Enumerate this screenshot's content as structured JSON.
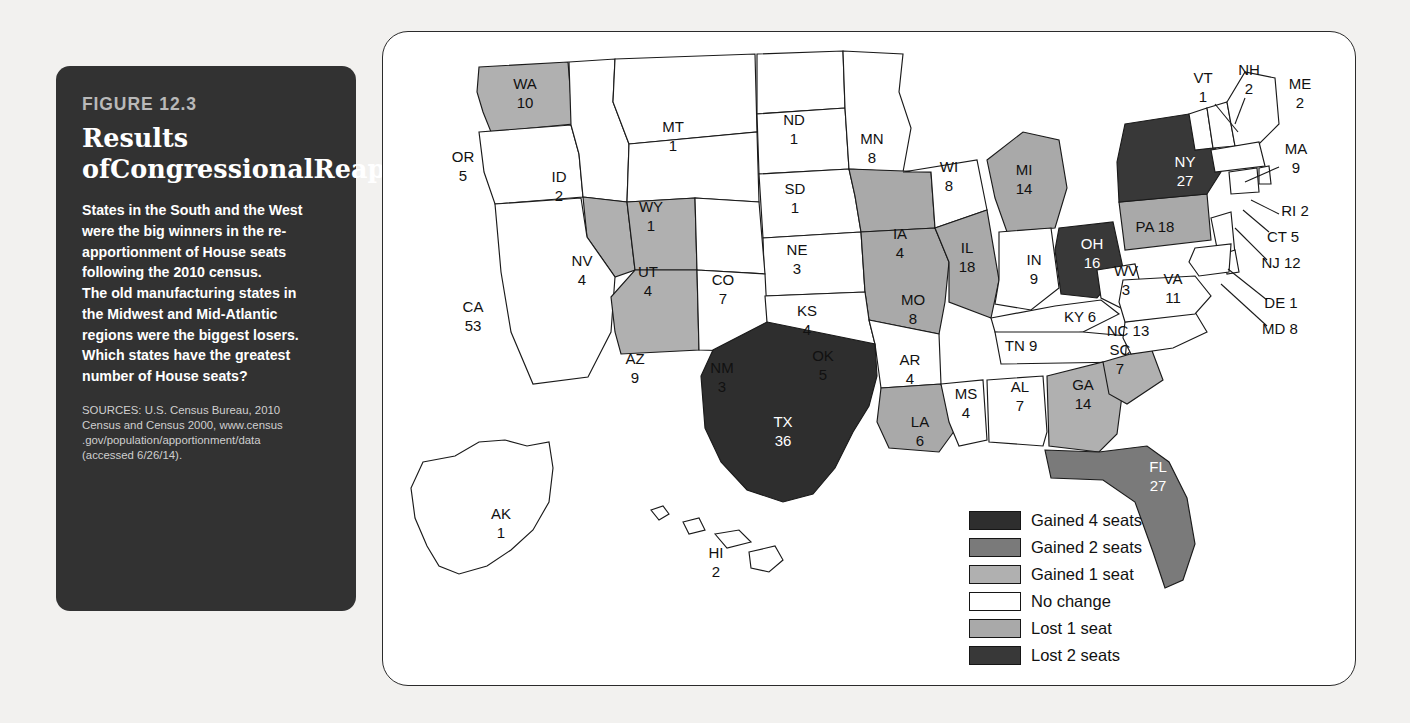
{
  "figure": {
    "number": "FIGURE 12.3",
    "title_lines": [
      "Results of",
      "Congressional",
      "Reapportionment,",
      "2010"
    ],
    "body_lines": [
      "States in the South and the West",
      "were the big winners in the re-",
      "apportionment of House seats",
      "following the 2010 census.",
      "The old manufacturing states in",
      "the Midwest and Mid-Atlantic",
      "regions were the biggest losers.",
      "Which states have the greatest",
      "number of House seats?"
    ],
    "sources_lines": [
      "SOURCES: U.S. Census Bureau, 2010",
      "Census and Census 2000, www.census",
      ".gov/population/apportionment/data",
      "(accessed 6/26/14)."
    ]
  },
  "colors": {
    "gained4": "#2e2e2e",
    "gained2": "#7a7a7a",
    "gained1": "#b0b0b0",
    "nochange": "#ffffff",
    "lost1": "#a9a9a9",
    "lost2": "#383838",
    "card_bg": "#323232",
    "page_bg": "#f2f1ef",
    "outline": "#1a1a1a"
  },
  "legend": {
    "title": "",
    "items": [
      {
        "label": "Gained 4 seats",
        "color": "#2e2e2e",
        "key": "gained4"
      },
      {
        "label": "Gained 2 seats",
        "color": "#7a7a7a",
        "key": "gained2"
      },
      {
        "label": "Gained 1 seat",
        "color": "#b0b0b0",
        "key": "gained1"
      },
      {
        "label": "No change",
        "color": "#ffffff",
        "key": "nochange"
      },
      {
        "label": "Lost 1 seat",
        "color": "#a9a9a9",
        "key": "lost1"
      },
      {
        "label": "Lost 2 seats",
        "color": "#383838",
        "key": "lost2"
      }
    ]
  },
  "chart_data": {
    "type": "map",
    "value_label": "House seats",
    "category_label": "Reapportionment change",
    "categories": [
      "Gained 4 seats",
      "Gained 2 seats",
      "Gained 1 seat",
      "No change",
      "Lost 1 seat",
      "Lost 2 seats"
    ],
    "states": [
      {
        "code": "WA",
        "seats": 10,
        "category": "Gained 1 seat",
        "label_x": 142,
        "label_y": 62,
        "light_text": false
      },
      {
        "code": "OR",
        "seats": 5,
        "category": "No change",
        "label_x": 80,
        "label_y": 135,
        "light_text": false
      },
      {
        "code": "ID",
        "seats": 2,
        "category": "No change",
        "label_x": 176,
        "label_y": 155,
        "light_text": false
      },
      {
        "code": "MT",
        "seats": 1,
        "category": "No change",
        "label_x": 290,
        "label_y": 105,
        "light_text": false
      },
      {
        "code": "WY",
        "seats": 1,
        "category": "No change",
        "label_x": 268,
        "label_y": 185,
        "light_text": false
      },
      {
        "code": "ND",
        "seats": 1,
        "category": "No change",
        "label_x": 411,
        "label_y": 98,
        "light_text": false
      },
      {
        "code": "SD",
        "seats": 1,
        "category": "No change",
        "label_x": 412,
        "label_y": 167,
        "light_text": false
      },
      {
        "code": "NE",
        "seats": 3,
        "category": "No change",
        "label_x": 414,
        "label_y": 228,
        "light_text": false
      },
      {
        "code": "KS",
        "seats": 4,
        "category": "No change",
        "label_x": 424,
        "label_y": 289,
        "light_text": false
      },
      {
        "code": "MN",
        "seats": 8,
        "category": "No change",
        "label_x": 489,
        "label_y": 117,
        "light_text": false
      },
      {
        "code": "IA",
        "seats": 4,
        "category": "Lost 1 seat",
        "label_x": 517,
        "label_y": 212,
        "light_text": false
      },
      {
        "code": "MO",
        "seats": 8,
        "category": "Lost 1 seat",
        "label_x": 530,
        "label_y": 278,
        "light_text": false
      },
      {
        "code": "WI",
        "seats": 8,
        "category": "No change",
        "label_x": 566,
        "label_y": 145,
        "light_text": false
      },
      {
        "code": "IL",
        "seats": 18,
        "category": "Lost 1 seat",
        "label_x": 584,
        "label_y": 226,
        "light_text": false
      },
      {
        "code": "MI",
        "seats": 14,
        "category": "Lost 1 seat",
        "label_x": 641,
        "label_y": 148,
        "light_text": false
      },
      {
        "code": "IN",
        "seats": 9,
        "category": "No change",
        "label_x": 651,
        "label_y": 238,
        "light_text": false
      },
      {
        "code": "OH",
        "seats": 16,
        "category": "Lost 2 seats",
        "label_x": 709,
        "label_y": 222,
        "light_text": true
      },
      {
        "code": "KY",
        "seats": 6,
        "category": "No change",
        "label_x": 697,
        "label_y": 286,
        "light_text": false
      },
      {
        "code": "NV",
        "seats": 4,
        "category": "Gained 1 seat",
        "label_x": 199,
        "label_y": 239,
        "light_text": false
      },
      {
        "code": "UT",
        "seats": 4,
        "category": "Gained 1 seat",
        "label_x": 265,
        "label_y": 250,
        "light_text": false
      },
      {
        "code": "CO",
        "seats": 7,
        "category": "No change",
        "label_x": 340,
        "label_y": 258,
        "light_text": false
      },
      {
        "code": "CA",
        "seats": 53,
        "category": "No change",
        "label_x": 90,
        "label_y": 285,
        "light_text": false
      },
      {
        "code": "AZ",
        "seats": 9,
        "category": "Gained 1 seat",
        "label_x": 252,
        "label_y": 337,
        "light_text": false
      },
      {
        "code": "NM",
        "seats": 3,
        "category": "No change",
        "label_x": 339,
        "label_y": 346,
        "light_text": false
      },
      {
        "code": "OK",
        "seats": 5,
        "category": "No change",
        "label_x": 440,
        "label_y": 334,
        "light_text": false
      },
      {
        "code": "AR",
        "seats": 4,
        "category": "No change",
        "label_x": 527,
        "label_y": 338,
        "light_text": false
      },
      {
        "code": "TX",
        "seats": 36,
        "category": "Gained 4 seats",
        "label_x": 400,
        "label_y": 400,
        "light_text": true
      },
      {
        "code": "LA",
        "seats": 6,
        "category": "Lost 1 seat",
        "label_x": 537,
        "label_y": 400,
        "light_text": false
      },
      {
        "code": "MS",
        "seats": 4,
        "category": "No change",
        "label_x": 583,
        "label_y": 372,
        "light_text": false
      },
      {
        "code": "AL",
        "seats": 7,
        "category": "No change",
        "label_x": 637,
        "label_y": 365,
        "light_text": false
      },
      {
        "code": "TN",
        "seats": 9,
        "category": "No change",
        "label_x": 638,
        "label_y": 315,
        "light_text": false
      },
      {
        "code": "GA",
        "seats": 14,
        "category": "Gained 1 seat",
        "label_x": 700,
        "label_y": 363,
        "light_text": false
      },
      {
        "code": "SC",
        "seats": 7,
        "category": "Gained 1 seat",
        "label_x": 737,
        "label_y": 328,
        "light_text": false
      },
      {
        "code": "NC",
        "seats": 13,
        "category": "No change",
        "label_x": 745,
        "label_y": 300,
        "light_text": false
      },
      {
        "code": "FL",
        "seats": 27,
        "category": "Gained 2 seats",
        "label_x": 775,
        "label_y": 445,
        "light_text": true
      },
      {
        "code": "WV",
        "seats": 3,
        "category": "No change",
        "label_x": 743,
        "label_y": 249,
        "light_text": false
      },
      {
        "code": "VA",
        "seats": 11,
        "category": "No change",
        "label_x": 790,
        "label_y": 257,
        "light_text": false
      },
      {
        "code": "PA",
        "seats": 18,
        "category": "Lost 1 seat",
        "label_x": 772,
        "label_y": 196,
        "light_text": false
      },
      {
        "code": "NY",
        "seats": 27,
        "category": "Lost 2 seats",
        "label_x": 802,
        "label_y": 140,
        "light_text": true
      },
      {
        "code": "VT",
        "seats": 1,
        "category": "No change",
        "label_x": 820,
        "label_y": 56,
        "light_text": false
      },
      {
        "code": "NH",
        "seats": 2,
        "category": "No change",
        "label_x": 866,
        "label_y": 48,
        "light_text": false
      },
      {
        "code": "ME",
        "seats": 2,
        "category": "No change",
        "label_x": 917,
        "label_y": 62,
        "light_text": false
      },
      {
        "code": "MA",
        "seats": 9,
        "category": "No change",
        "label_x": 913,
        "label_y": 127,
        "light_text": false
      },
      {
        "code": "RI",
        "seats": 2,
        "category": "No change",
        "label_x": 912,
        "label_y": 180,
        "light_text": false
      },
      {
        "code": "CT",
        "seats": 5,
        "category": "No change",
        "label_x": 900,
        "label_y": 206,
        "light_text": false
      },
      {
        "code": "NJ",
        "seats": 12,
        "category": "No change",
        "label_x": 898,
        "label_y": 232,
        "light_text": false
      },
      {
        "code": "DE",
        "seats": 1,
        "category": "No change",
        "label_x": 898,
        "label_y": 272,
        "light_text": false
      },
      {
        "code": "MD",
        "seats": 8,
        "category": "No change",
        "label_x": 897,
        "label_y": 298,
        "light_text": false
      },
      {
        "code": "AK",
        "seats": 1,
        "category": "No change",
        "label_x": 118,
        "label_y": 492,
        "light_text": false
      },
      {
        "code": "HI",
        "seats": 2,
        "category": "No change",
        "label_x": 333,
        "label_y": 531,
        "light_text": false
      }
    ]
  }
}
